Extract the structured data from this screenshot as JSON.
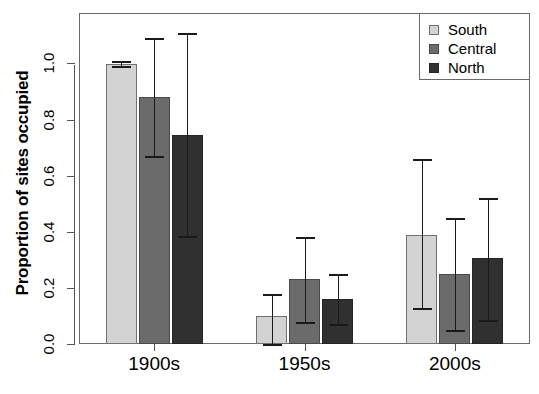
{
  "chart_data": {
    "type": "bar",
    "title": "",
    "xlabel": "",
    "ylabel": "Proportion of sites occupied",
    "categories": [
      "1900s",
      "1950s",
      "2000s"
    ],
    "ylim": [
      0.0,
      1.18
    ],
    "yticks": [
      0.0,
      0.2,
      0.4,
      0.6,
      0.8,
      1.0
    ],
    "ytick_labels": [
      "0.0",
      "0.2",
      "0.4",
      "0.6",
      "0.8",
      "1.0"
    ],
    "grid": false,
    "legend_position": "top-right",
    "error_bars": true,
    "series": [
      {
        "name": "South",
        "color": "#d3d3d3",
        "values": [
          1.0,
          0.1,
          0.39
        ],
        "err_low": [
          0.99,
          0.0,
          0.13
        ],
        "err_high": [
          1.01,
          0.18,
          0.66
        ]
      },
      {
        "name": "Central",
        "color": "#6b6b6b",
        "values": [
          0.88,
          0.23,
          0.25
        ],
        "err_low": [
          0.67,
          0.08,
          0.05
        ],
        "err_high": [
          1.09,
          0.38,
          0.45
        ]
      },
      {
        "name": "North",
        "color": "#303030",
        "values": [
          0.745,
          0.16,
          0.305
        ],
        "err_low": [
          0.385,
          0.07,
          0.085
        ],
        "err_high": [
          1.11,
          0.25,
          0.52
        ]
      }
    ]
  },
  "legend": {
    "items": [
      {
        "label": "South",
        "color": "#d3d3d3"
      },
      {
        "label": "Central",
        "color": "#6b6b6b"
      },
      {
        "label": "North",
        "color": "#303030"
      }
    ]
  },
  "caption": ""
}
